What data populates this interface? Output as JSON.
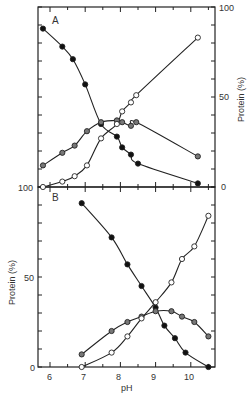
{
  "chart_data": [
    {
      "type": "line",
      "panel_label": "A",
      "xlabel": "pH",
      "ylabel": "Protein (%)",
      "ylabel_side": "right",
      "xlim": [
        5.65,
        10.7
      ],
      "ylim": [
        0,
        100
      ],
      "yticks_labeled": [
        0,
        50,
        100
      ],
      "grid": false,
      "legend": null,
      "series": [
        {
          "name": "filled circles",
          "marker": "filled",
          "x": [
            5.8,
            6.35,
            6.65,
            7.0,
            7.45,
            7.9,
            8.05,
            8.3,
            8.5,
            10.2
          ],
          "y": [
            88,
            78,
            71,
            57,
            35,
            28,
            22,
            18,
            13,
            2
          ]
        },
        {
          "name": "half-filled circles",
          "marker": "half",
          "x": [
            5.8,
            6.35,
            6.7,
            7.05,
            7.45,
            7.9,
            8.05,
            8.3,
            8.45,
            10.2
          ],
          "y": [
            12,
            19,
            23,
            31,
            36,
            37,
            36,
            34,
            36,
            17
          ]
        },
        {
          "name": "open circles",
          "marker": "open",
          "x": [
            5.8,
            6.35,
            6.7,
            7.05,
            7.45,
            7.9,
            8.05,
            8.3,
            8.45,
            10.2
          ],
          "y": [
            0,
            3,
            6,
            12,
            27,
            35,
            42,
            47,
            51,
            83
          ]
        }
      ]
    },
    {
      "type": "line",
      "panel_label": "B",
      "xlabel": "pH",
      "ylabel": "Protein (%)",
      "ylabel_side": "left",
      "xlim": [
        5.65,
        10.7
      ],
      "ylim": [
        0,
        100
      ],
      "xticks": [
        6,
        7,
        8,
        9,
        10
      ],
      "yticks_labeled": [
        0,
        50,
        100
      ],
      "grid": false,
      "legend": null,
      "series": [
        {
          "name": "filled circles",
          "marker": "filled",
          "x": [
            6.9,
            7.75,
            8.2,
            8.6,
            9.0,
            9.25,
            9.55,
            9.85,
            10.5
          ],
          "y": [
            91,
            72,
            57,
            45,
            33,
            23,
            16,
            8,
            0
          ]
        },
        {
          "name": "half-filled circles",
          "marker": "half",
          "x": [
            6.9,
            7.75,
            8.2,
            8.6,
            9.0,
            9.45,
            9.75,
            10.1,
            10.5
          ],
          "y": [
            7,
            20,
            25,
            28,
            31,
            31,
            28,
            25,
            17
          ]
        },
        {
          "name": "open circles",
          "marker": "open",
          "x": [
            6.9,
            7.75,
            8.2,
            8.6,
            9.0,
            9.45,
            9.75,
            10.1,
            10.5
          ],
          "y": [
            0,
            8,
            17,
            27,
            36,
            47,
            60,
            67,
            84
          ]
        }
      ]
    }
  ],
  "labels": {
    "panel_a": "A",
    "panel_b": "B",
    "xlabel": "pH",
    "ylabel_a": "Protein (%)",
    "ylabel_b": "Protein (%)",
    "a_right_ticks": [
      "100",
      "50",
      "0"
    ],
    "b_left_ticks": [
      "100",
      "50",
      "0"
    ],
    "x_ticks": [
      "6",
      "7",
      "8",
      "9",
      "10"
    ]
  }
}
